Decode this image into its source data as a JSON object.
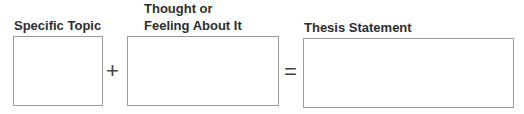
{
  "diagram": {
    "topic": {
      "label": "Specific Topic"
    },
    "thought": {
      "label_line1": "Thought or",
      "label_line2": "Feeling About It"
    },
    "thesis": {
      "label": "Thesis Statement"
    },
    "operators": {
      "plus": "+",
      "equals": "="
    }
  }
}
